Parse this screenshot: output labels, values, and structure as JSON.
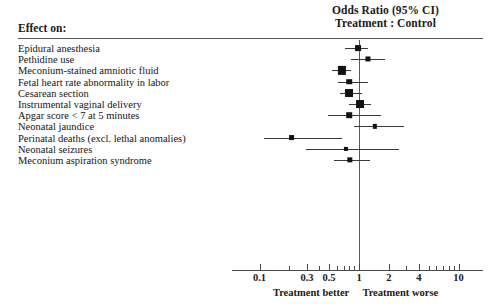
{
  "header": {
    "column_label": "Effect on:",
    "title_line1": "Odds Ratio (95% CI)",
    "title_line2": "Treatment : Control"
  },
  "axis": {
    "left_caption": "Treatment better",
    "right_caption": "Treatment worse",
    "tick_labels": [
      "0.1",
      "0.3",
      "0.5",
      "1",
      "2",
      "4",
      "10"
    ],
    "tick_values": [
      0.1,
      0.3,
      0.5,
      1,
      2,
      4,
      10
    ],
    "minor_tick_values": [
      0.2,
      0.4,
      0.6,
      0.7,
      0.8,
      0.9,
      3,
      5,
      6,
      7,
      8,
      9
    ],
    "scale": "log",
    "range": [
      0.09,
      11
    ],
    "null_value": 1
  },
  "colors": {
    "marker": "#111111",
    "ci_line": "#3a3a3a",
    "rule": "#555555",
    "background": "#ffffff",
    "text": "#151515"
  },
  "chart_data": {
    "type": "forest",
    "title": "Odds Ratio (95% CI)",
    "subtitle": "Treatment : Control",
    "xlabel": "Odds Ratio (95% CI)",
    "ylabel": "Effect on:",
    "xscale": "log",
    "xlim": [
      0.09,
      11
    ],
    "xticks": [
      0.1,
      0.3,
      0.5,
      1,
      2,
      4,
      10
    ],
    "xticklabels": [
      "0.1",
      "0.3",
      "0.5",
      "1",
      "2",
      "4",
      "10"
    ],
    "reference_line": 1,
    "grid": false,
    "legend": null,
    "annotations": [
      "Treatment better",
      "Treatment worse"
    ],
    "categories": [
      "Epidural anesthesia",
      "Pethidine use",
      "Meconium-stained amniotic fluid",
      "Fetal heart rate abnormality in labor",
      "Cesarean section",
      "Instrumental vaginal delivery",
      "Apgar score < 7 at 5 minutes",
      "Neonatal jaundice",
      "Perinatal deaths (excl. lethal anomalies)",
      "Neonatal seizures",
      "Meconium aspiration syndrome"
    ],
    "points": [
      {
        "label": "Epidural anesthesia",
        "or": 0.98,
        "ci_low": 0.72,
        "ci_high": 1.24,
        "weight": 0.55
      },
      {
        "label": "Pethidine use",
        "or": 1.24,
        "ci_low": 0.83,
        "ci_high": 1.81,
        "weight": 0.4
      },
      {
        "label": "Meconium-stained amniotic fluid",
        "or": 0.67,
        "ci_low": 0.53,
        "ci_high": 0.84,
        "weight": 1.0
      },
      {
        "label": "Fetal heart rate abnormality in labor",
        "or": 0.8,
        "ci_low": 0.62,
        "ci_high": 1.24,
        "weight": 0.5
      },
      {
        "label": "Cesarean section",
        "or": 0.8,
        "ci_low": 0.64,
        "ci_high": 1.06,
        "weight": 0.95
      },
      {
        "label": "Instrumental vaginal delivery",
        "or": 1.02,
        "ci_low": 0.79,
        "ci_high": 1.33,
        "weight": 0.95
      },
      {
        "label": "Apgar score < 7 at 5 minutes",
        "or": 0.8,
        "ci_low": 0.49,
        "ci_high": 1.68,
        "weight": 0.5
      },
      {
        "label": "Neonatal jaundice",
        "or": 1.45,
        "ci_low": 0.89,
        "ci_high": 2.85,
        "weight": 0.25
      },
      {
        "label": "Perinatal deaths (excl. lethal anomalies)",
        "or": 0.21,
        "ci_low": 0.11,
        "ci_high": 0.67,
        "weight": 0.55
      },
      {
        "label": "Neonatal seizures",
        "or": 0.74,
        "ci_low": 0.29,
        "ci_high": 2.5,
        "weight": 0.22
      },
      {
        "label": "Meconium aspiration syndrome",
        "or": 0.81,
        "ci_low": 0.56,
        "ci_high": 1.3,
        "weight": 0.45
      }
    ]
  }
}
